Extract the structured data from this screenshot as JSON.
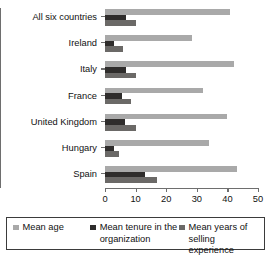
{
  "chart_data": {
    "type": "bar",
    "orientation": "horizontal",
    "title": "",
    "xlabel": "",
    "ylabel": "",
    "xlim": [
      0,
      50
    ],
    "xticks": [
      0,
      10,
      20,
      30,
      40,
      50
    ],
    "xtick_labels": [
      "0",
      "10",
      "20",
      "30",
      "40",
      "50"
    ],
    "grid": false,
    "legend_position": "bottom",
    "categories": [
      "All six countries",
      "Ireland",
      "Italy",
      "France",
      "United Kingdom",
      "Hungary",
      "Spain"
    ],
    "series": [
      {
        "name": "Mean age",
        "color": "#a9a9a9",
        "values": [
          41,
          28.5,
          42,
          32,
          40,
          34,
          43
        ]
      },
      {
        "name": "Mean tenure in the organization",
        "color": "#2f2d2c",
        "values": [
          7,
          3,
          7,
          5.5,
          6.5,
          3,
          13
        ]
      },
      {
        "name": "Mean years of selling experience",
        "color": "#6b6967",
        "values": [
          10,
          6,
          10,
          8.5,
          10,
          4.5,
          17
        ]
      }
    ]
  },
  "legend": {
    "items": [
      {
        "label": "Mean age",
        "color": "#a9a9a9"
      },
      {
        "label": "Mean tenure in the organization",
        "color": "#2f2d2c"
      },
      {
        "label": "Mean years of selling experience",
        "color": "#6b6967"
      }
    ]
  }
}
